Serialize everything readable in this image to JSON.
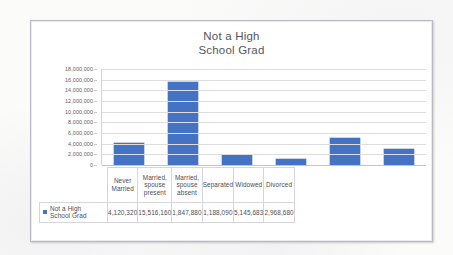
{
  "document": {
    "background_color": "#fbfbfa",
    "frame_color": "#b9b9c4"
  },
  "chart_data": {
    "type": "bar",
    "title": "Not a High School Grad",
    "title_lines": [
      "Not a High",
      "School Grad"
    ],
    "categories": [
      "Never Married",
      "Married, spouse present",
      "Married, spouse absent",
      "Separated",
      "Widowed",
      "Divorced"
    ],
    "category_lines": [
      [
        "Never",
        "Married"
      ],
      [
        "Married,",
        "spouse",
        "present"
      ],
      [
        "Married,",
        "spouse",
        "absent"
      ],
      [
        "Separated"
      ],
      [
        "Widowed"
      ],
      [
        "Divorced"
      ]
    ],
    "values": [
      4120320,
      15516160,
      1847880,
      1188090,
      5145683,
      2968680
    ],
    "value_labels": [
      "4,120,320",
      "15,516,160",
      "1,847,880",
      "1,188,090",
      "5,145,683",
      "2,968,680"
    ],
    "series": [
      {
        "name": "Not a High School Grad",
        "color": "#4472c4",
        "values": [
          4120320,
          15516160,
          1847880,
          1188090,
          5145683,
          2968680
        ]
      }
    ],
    "legend": {
      "entries": [
        "Not a High School Grad"
      ],
      "entry_lines": [
        "Not a High",
        "School Grad"
      ],
      "position": "data-table-row-header",
      "swatch_color": "#4472c4"
    },
    "xlabel": "",
    "ylabel": "",
    "ylim": [
      0,
      18000000
    ],
    "ytick_step": 2000000,
    "ytick_labels": [
      "18,000,000",
      "16,000,000",
      "14,000,000",
      "12,000,000",
      "10,000,000",
      "8,000,000",
      "6,000,000",
      "4,000,000",
      "2,000,000",
      "0"
    ],
    "ytick_values": [
      18000000,
      16000000,
      14000000,
      12000000,
      10000000,
      8000000,
      6000000,
      4000000,
      2000000,
      0
    ],
    "grid": true,
    "grid_color": "#dcdce1",
    "has_data_table": true
  }
}
